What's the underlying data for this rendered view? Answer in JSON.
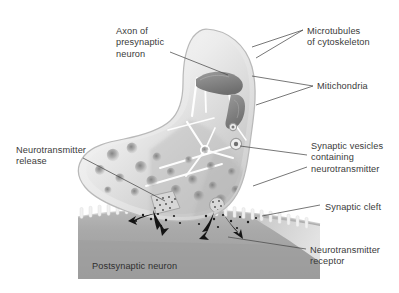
{
  "figure": {
    "palette": {
      "background": "#ffffff",
      "label_text": "#3a3a3a",
      "leader_line": "#4a4a4a",
      "terminal_fill_light": "#f3f3f3",
      "terminal_fill_mid": "#cfcfcf",
      "terminal_outline": "#b5b5b5",
      "mitochondria": "#8c8c8c",
      "vesicle": "#9a9a9a",
      "microtubule": "#ffffff",
      "postsynaptic": "#a8a8a8",
      "receptor": "#efefef",
      "arrow": "#1a1a1a"
    }
  },
  "labels": [
    {
      "id": "axon-of-presynaptic-neuron",
      "lines": [
        "Axon of",
        "presynaptic",
        "neuron"
      ],
      "text": "Axon of presynaptic neuron",
      "x": 116,
      "y": 26,
      "align": "left"
    },
    {
      "id": "microtubules-of-cytoskeleton",
      "lines": [
        "Microtubules",
        "of cytoskeleton"
      ],
      "text": "Microtubules of cytoskeleton",
      "x": 307,
      "y": 26,
      "align": "left"
    },
    {
      "id": "mitichondria",
      "lines": [
        "Mitichondria"
      ],
      "text": "Mitichondria",
      "x": 317,
      "y": 81,
      "align": "left"
    },
    {
      "id": "synaptic-vesicles-containing-neurotransmitter",
      "lines": [
        "Synaptic vesicles",
        "containing",
        "neurotransmitter"
      ],
      "text": "Synaptic vesicles containing neurotransmitter",
      "x": 311,
      "y": 141,
      "align": "left"
    },
    {
      "id": "neurotransmitter-release",
      "lines": [
        "Neurotransmitter",
        "release"
      ],
      "text": "Neurotransmitter release",
      "x": 16,
      "y": 145,
      "align": "left"
    },
    {
      "id": "synaptic-cleft",
      "lines": [
        "Synaptic cleft"
      ],
      "text": "Synaptic cleft",
      "x": 325,
      "y": 202,
      "align": "left"
    },
    {
      "id": "neurotransmitter-receptor",
      "lines": [
        "Neurotransmitter",
        "receptor"
      ],
      "text": "Neurotransmitter receptor",
      "x": 310,
      "y": 245,
      "align": "left"
    },
    {
      "id": "postsynaptic-neuron",
      "lines": [
        "Postsynaptic neuron"
      ],
      "text": "Postsynaptic neuron",
      "x": 92,
      "y": 261,
      "align": "left"
    }
  ],
  "structures": {
    "axon_terminal": "presynaptic axon terminal bulb",
    "mitochondria_count": 2,
    "vesicle_count": 22,
    "microtubule_count": 9,
    "receptor_count": 26,
    "release_arrow_count": 4,
    "fusing_vesicle_count": 2
  }
}
